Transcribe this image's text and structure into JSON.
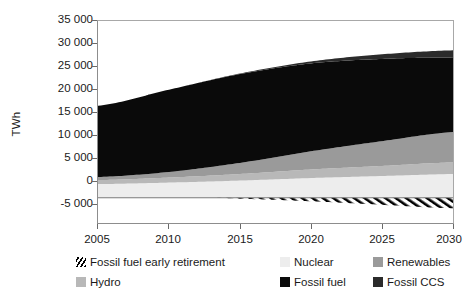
{
  "chart": {
    "ylabel": "TWh",
    "xlabel": ""
  },
  "axis": {
    "y_ticks": [
      "35 000",
      "30 000",
      "25 000",
      "20 000",
      "15 000",
      "10 000",
      "5 000",
      "0",
      "-5 000"
    ],
    "x_ticks": [
      "2005",
      "2010",
      "2015",
      "2020",
      "2025",
      "2030"
    ]
  },
  "legend": {
    "items": [
      {
        "label": "Fossil fuel early retirement",
        "color": "#000000",
        "style": "hatch"
      },
      {
        "label": "Nuclear",
        "color": "#ededed",
        "style": "solid"
      },
      {
        "label": "Renewables",
        "color": "#9a9a9a",
        "style": "solid"
      },
      {
        "label": "Hydro",
        "color": "#b8b8b8",
        "style": "solid"
      },
      {
        "label": "Fossil fuel",
        "color": "#0a0a0a",
        "style": "solid"
      },
      {
        "label": "Fossil CCS",
        "color": "#2b2b2b",
        "style": "solid"
      }
    ]
  },
  "chart_data": {
    "type": "area",
    "title": "",
    "xlabel": "",
    "ylabel": "TWh",
    "xlim": [
      2005,
      2030
    ],
    "ylim": [
      -5000,
      35000
    ],
    "ytick_values": [
      -5000,
      0,
      5000,
      10000,
      15000,
      20000,
      25000,
      30000,
      35000
    ],
    "xtick_values": [
      2005,
      2010,
      2015,
      2020,
      2025,
      2030
    ],
    "grid": false,
    "legend_position": "below",
    "stacking": "stacked",
    "x": [
      2005,
      2010,
      2015,
      2020,
      2025,
      2030
    ],
    "series": [
      {
        "name": "Nuclear",
        "color": "#ededed",
        "values": [
          2700,
          3000,
          3400,
          3900,
          4300,
          4700
        ]
      },
      {
        "name": "Hydro",
        "color": "#b8b8b8",
        "values": [
          800,
          1000,
          1300,
          1700,
          2000,
          2300
        ]
      },
      {
        "name": "Renewables",
        "color": "#9a9a9a",
        "values": [
          600,
          1100,
          2200,
          3600,
          4900,
          6000
        ]
      },
      {
        "name": "Fossil fuel",
        "color": "#0a0a0a",
        "values": [
          14100,
          16300,
          17600,
          17400,
          16300,
          14800
        ]
      },
      {
        "name": "Fossil CCS",
        "color": "#2b2b2b",
        "values": [
          0,
          0,
          100,
          400,
          900,
          1400
        ]
      }
    ],
    "negative_series": [
      {
        "name": "Fossil fuel early retirement",
        "color": "#000000",
        "style": "hatch",
        "x": [
          2005,
          2010,
          2013,
          2015,
          2020,
          2025,
          2030
        ],
        "values": [
          0,
          0,
          0,
          -200,
          -700,
          -1400,
          -2100
        ]
      }
    ],
    "totals": [
      18200,
      21400,
      24600,
      27000,
      28400,
      29200
    ]
  }
}
